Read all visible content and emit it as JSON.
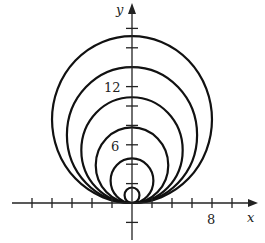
{
  "chart_data": {
    "type": "line",
    "title": "",
    "xlabel": "x",
    "ylabel": "y",
    "x_tick_labels": [
      {
        "value": 8,
        "label": "8"
      }
    ],
    "y_tick_labels": [
      {
        "value": 6,
        "label": "6"
      },
      {
        "value": 12,
        "label": "12"
      }
    ],
    "tick_spacing": 2,
    "xlim": [
      -10,
      12
    ],
    "ylim": [
      -4,
      18
    ],
    "grid": false,
    "series": [
      {
        "name": "circle-1",
        "diameter": 1.6
      },
      {
        "name": "circle-2",
        "diameter": 4.6
      },
      {
        "name": "circle-3",
        "diameter": 7.8
      },
      {
        "name": "circle-4",
        "diameter": 10.9
      },
      {
        "name": "circle-5",
        "diameter": 14.0
      },
      {
        "name": "circle-6",
        "diameter": 17.2
      }
    ]
  },
  "axes": {
    "x_label": "x",
    "y_label": "y",
    "x_tick_8": "8",
    "y_tick_6": "6",
    "y_tick_12": "12"
  }
}
